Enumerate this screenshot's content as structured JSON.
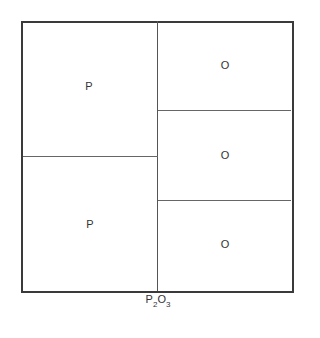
{
  "diagram": {
    "left_cells": [
      {
        "label": "P"
      },
      {
        "label": "P"
      }
    ],
    "right_cells": [
      {
        "label": "O"
      },
      {
        "label": "O"
      },
      {
        "label": "O"
      }
    ],
    "caption": {
      "p": "P",
      "p_sub": "2",
      "o": "O",
      "o_sub": "3"
    }
  }
}
